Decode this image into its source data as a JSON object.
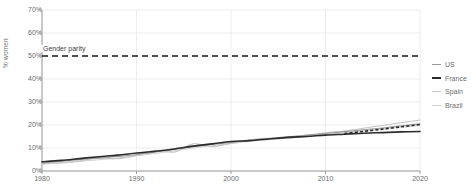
{
  "chart_data": {
    "type": "line",
    "title": "",
    "xlabel": "",
    "ylabel": "% women",
    "xlim": [
      1980,
      2020
    ],
    "ylim": [
      0,
      70
    ],
    "y_tick_labels": [
      "70%",
      "60%",
      "50%",
      "40%",
      "30%",
      "20%",
      "10%",
      "0%"
    ],
    "y_tick_values": [
      70,
      60,
      50,
      40,
      30,
      20,
      10,
      0
    ],
    "x_tick_labels": [
      "1980",
      "1990",
      "2000",
      "2010",
      "2020"
    ],
    "x_tick_values": [
      1980,
      1990,
      2000,
      2010,
      2020
    ],
    "grid": true,
    "legend_position": "right",
    "annotations": [
      {
        "name": "gender-parity",
        "label": "Gender parity",
        "value": 50,
        "style": "dashed-horizontal-line",
        "color": "#1a1a1a"
      }
    ],
    "series": [
      {
        "name": "US",
        "color": "#9a9a9a",
        "width": 1.1,
        "x": [
          1980,
          1982,
          1984,
          1986,
          1988,
          1990,
          1992,
          1994,
          1996,
          1998,
          2000,
          2002,
          2004,
          2006,
          2008,
          2010,
          2012,
          2014,
          2016,
          2018,
          2020
        ],
        "values": [
          3.5,
          4.2,
          5.0,
          5.6,
          6.3,
          7.2,
          8.2,
          9.4,
          10.6,
          11.5,
          12.4,
          13.3,
          14.1,
          14.9,
          15.6,
          16.3,
          17.1,
          17.9,
          18.7,
          19.6,
          20.5
        ]
      },
      {
        "name": "France",
        "color": "#2b2b2b",
        "width": 1.6,
        "x": [
          1980,
          1982,
          1984,
          1986,
          1988,
          1990,
          1992,
          1994,
          1996,
          1998,
          2000,
          2002,
          2004,
          2006,
          2008,
          2010,
          2012,
          2014,
          2016,
          2018,
          2020
        ],
        "values": [
          4.0,
          4.6,
          5.4,
          6.2,
          6.9,
          7.8,
          8.6,
          9.6,
          10.8,
          11.8,
          12.8,
          13.2,
          13.9,
          14.6,
          15.0,
          15.6,
          16.0,
          16.4,
          16.7,
          17.0,
          17.2
        ],
        "projection": {
          "x": [
            2012,
            2014,
            2016,
            2018,
            2020
          ],
          "values": [
            16.3,
            17.2,
            18.2,
            19.2,
            20.2
          ],
          "style": "dashed"
        }
      },
      {
        "name": "Spain",
        "color": "#c6c6c6",
        "width": 1.1,
        "x": [
          1980,
          1982,
          1984,
          1986,
          1988,
          1990,
          1992,
          1994,
          1996,
          1998,
          2000,
          2002,
          2004,
          2006,
          2008,
          2010,
          2012,
          2014,
          2016,
          2018,
          2020
        ],
        "values": [
          3.2,
          3.6,
          4.4,
          5.8,
          5.4,
          6.8,
          9.0,
          8.2,
          11.8,
          10.6,
          12.0,
          13.6,
          14.2,
          14.2,
          15.4,
          16.6,
          17.4,
          18.6,
          19.8,
          21.0,
          22.2
        ]
      },
      {
        "name": "Brazil",
        "color": "#d2d2d2",
        "width": 1.1,
        "x": [
          1980,
          1982,
          1984,
          1986,
          1988,
          1990,
          1992,
          1994,
          1996,
          1998,
          2000,
          2002,
          2004,
          2006,
          2008,
          2010,
          2012,
          2014,
          2016,
          2018,
          2020
        ],
        "values": [
          3.0,
          3.5,
          4.2,
          4.9,
          5.6,
          6.6,
          7.6,
          8.8,
          10.0,
          11.0,
          12.0,
          12.9,
          13.6,
          14.3,
          15.0,
          15.8,
          16.6,
          17.4,
          18.2,
          19.0,
          19.8
        ]
      }
    ]
  },
  "legend": {
    "items": [
      {
        "label": "US",
        "color": "#9a9a9a",
        "width": 1.3
      },
      {
        "label": "France",
        "color": "#2b2b2b",
        "width": 2.0
      },
      {
        "label": "Spain",
        "color": "#c6c6c6",
        "width": 1.3
      },
      {
        "label": "Brazil",
        "color": "#d2d2d2",
        "width": 1.3
      }
    ]
  }
}
